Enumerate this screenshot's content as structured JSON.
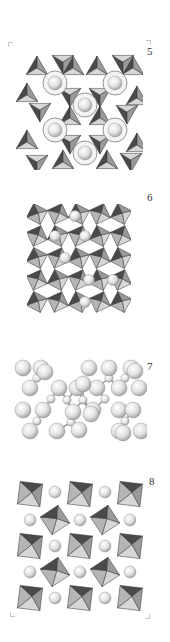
{
  "figure": {
    "panels": [
      {
        "id": "5",
        "label": "5",
        "type": "polyhedra-hexagonal-rings",
        "box": [
          15,
          50,
          128,
          120
        ],
        "label_pos": [
          147,
          46
        ]
      },
      {
        "id": "6",
        "label": "6",
        "type": "polyhedra-dense-framework",
        "box": [
          27,
          204,
          104,
          110
        ],
        "label_pos": [
          147,
          192
        ]
      },
      {
        "id": "7",
        "label": "7",
        "type": "ball-cluster",
        "box": [
          13,
          358,
          134,
          84
        ],
        "label_pos": [
          147,
          361
        ]
      },
      {
        "id": "8",
        "label": "8",
        "type": "polyhedra-octahedral-grid",
        "box": [
          15,
          478,
          130,
          136
        ],
        "label_pos": [
          149,
          476
        ]
      }
    ],
    "corner_marks": [
      {
        "pos": [
          8,
          42
        ],
        "kind": "tl"
      },
      {
        "pos": [
          146,
          40
        ],
        "kind": "tr"
      },
      {
        "pos": [
          10,
          612
        ],
        "kind": "bl"
      },
      {
        "pos": [
          145,
          614
        ],
        "kind": "br"
      }
    ],
    "colors": {
      "face_light": "#d6d6d6",
      "face_mid": "#9a9a9a",
      "face_dark": "#4a4a4a",
      "edge": "#333333",
      "sphere_hi": "#ffffff",
      "sphere_lo": "#9c9c9c"
    }
  }
}
